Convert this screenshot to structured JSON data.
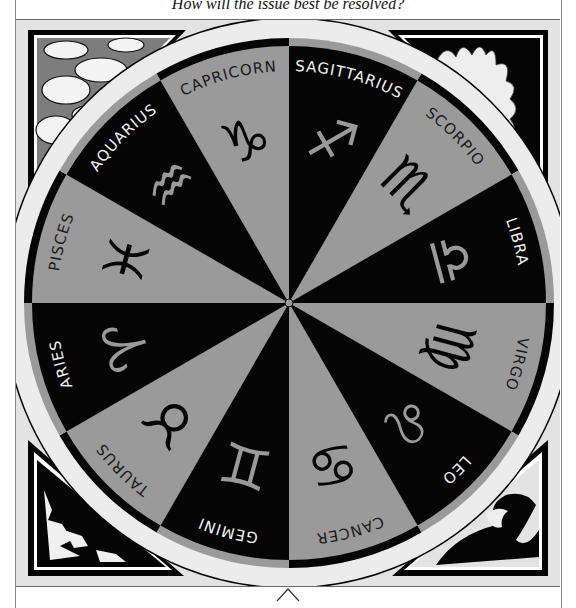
{
  "question": "How will the issue best be resolved?",
  "wheel": {
    "colors": {
      "dark": "#050505",
      "light": "#9a9a9a",
      "frame_bg": "#e3e3e3",
      "ring_light": "#ececec"
    },
    "signs": [
      {
        "name": "SAGITTARIUS",
        "glyph": "♐",
        "shade": "dark"
      },
      {
        "name": "SCORPIO",
        "glyph": "♏",
        "shade": "light"
      },
      {
        "name": "LIBRA",
        "glyph": "♎",
        "shade": "dark"
      },
      {
        "name": "VIRGO",
        "glyph": "♍",
        "shade": "light"
      },
      {
        "name": "LEO",
        "glyph": "♌",
        "shade": "dark"
      },
      {
        "name": "CANCER",
        "glyph": "♋",
        "shade": "light"
      },
      {
        "name": "GEMINI",
        "glyph": "♊",
        "shade": "dark"
      },
      {
        "name": "TAURUS",
        "glyph": "♉",
        "shade": "light"
      },
      {
        "name": "ARIES",
        "glyph": "♈",
        "shade": "dark"
      },
      {
        "name": "PISCES",
        "glyph": "♓",
        "shade": "light"
      },
      {
        "name": "AQUARIUS",
        "glyph": "♒",
        "shade": "dark"
      },
      {
        "name": "CAPRICORN",
        "glyph": "♑",
        "shade": "light"
      }
    ],
    "corners": [
      {
        "element": "air",
        "depiction": "clouds-icon",
        "position": "top-left"
      },
      {
        "element": "fire",
        "depiction": "flames-icon",
        "position": "top-right"
      },
      {
        "element": "earth",
        "depiction": "mountain-icon",
        "position": "bottom-left"
      },
      {
        "element": "water",
        "depiction": "wave-icon",
        "position": "bottom-right"
      }
    ]
  },
  "nav": {
    "arrow": "up-arrow-icon"
  }
}
